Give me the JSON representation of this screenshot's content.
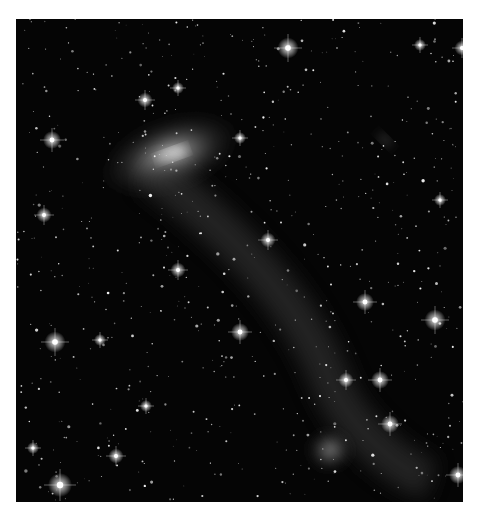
{
  "image": {
    "subject": "deep-field star field with a jellyfish-like galaxy and faint tidal stream",
    "palette": {
      "background": "#050505",
      "stars": "#ffffff",
      "galaxy_core": "#e8e8e8",
      "galaxy_halo": "#8a8a8a",
      "page": "#ffffff"
    },
    "features": [
      {
        "name": "main-galaxy",
        "cx": 170,
        "cy": 155,
        "rx": 75,
        "ry": 38,
        "angle": -20
      },
      {
        "name": "tidal-stream",
        "path": "M150,170 C230,230 300,300 330,380 C350,430 400,470 430,480"
      },
      {
        "name": "small-elongated-galaxy",
        "cx": 385,
        "cy": 140,
        "rx": 12,
        "ry": 5,
        "angle": 45
      },
      {
        "name": "diffuse-galaxy-bottom",
        "cx": 330,
        "cy": 450,
        "rx": 24,
        "ry": 22,
        "angle": 0
      }
    ],
    "bright_stars": [
      {
        "x": 288,
        "y": 48,
        "r": 3.5
      },
      {
        "x": 52,
        "y": 140,
        "r": 3
      },
      {
        "x": 44,
        "y": 215,
        "r": 2.5
      },
      {
        "x": 55,
        "y": 342,
        "r": 3.5
      },
      {
        "x": 60,
        "y": 485,
        "r": 4
      },
      {
        "x": 240,
        "y": 332,
        "r": 3
      },
      {
        "x": 365,
        "y": 302,
        "r": 3
      },
      {
        "x": 435,
        "y": 320,
        "r": 3.5
      },
      {
        "x": 380,
        "y": 380,
        "r": 3
      },
      {
        "x": 390,
        "y": 424,
        "r": 3
      },
      {
        "x": 458,
        "y": 475,
        "r": 3
      },
      {
        "x": 268,
        "y": 240,
        "r": 2.5
      },
      {
        "x": 116,
        "y": 456,
        "r": 2.5
      },
      {
        "x": 145,
        "y": 100,
        "r": 2.5
      },
      {
        "x": 178,
        "y": 88,
        "r": 2
      },
      {
        "x": 240,
        "y": 138,
        "r": 2
      },
      {
        "x": 420,
        "y": 45,
        "r": 2
      },
      {
        "x": 178,
        "y": 270,
        "r": 2.5
      },
      {
        "x": 346,
        "y": 380,
        "r": 2.5
      },
      {
        "x": 462,
        "y": 48,
        "r": 2.5
      },
      {
        "x": 440,
        "y": 200,
        "r": 2
      },
      {
        "x": 100,
        "y": 340,
        "r": 2
      },
      {
        "x": 33,
        "y": 448,
        "r": 2
      },
      {
        "x": 146,
        "y": 406,
        "r": 2
      }
    ]
  },
  "caption": {
    "text": ""
  }
}
